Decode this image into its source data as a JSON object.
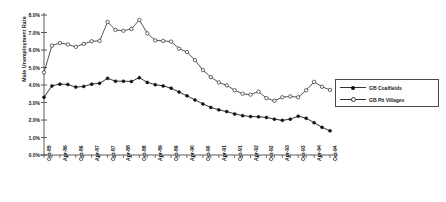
{
  "chart_data": {
    "type": "line",
    "title": "",
    "xlabel": "",
    "ylabel": "Male Unemployment Rate",
    "ylim": [
      0,
      8
    ],
    "ytick_labels": [
      "8.0%",
      "7.0%",
      "6.0%",
      "5.0%",
      "4.0%",
      "3.0%",
      "2.0%",
      "1.0%",
      "0.0%"
    ],
    "ytick_values": [
      8,
      7,
      6,
      5,
      4,
      3,
      2,
      1,
      0
    ],
    "grid": false,
    "legend_position": "right",
    "categories": [
      "Oct-85",
      "Jan-86",
      "Apr-86",
      "Jul-86",
      "Oct-86",
      "Jan-87",
      "Apr-87",
      "Jul-87",
      "Oct-87",
      "Jan-88",
      "Apr-88",
      "Jul-88",
      "Oct-88",
      "Jan-89",
      "Apr-89",
      "Jul-89",
      "Oct-89",
      "Jan-90",
      "Apr-90",
      "Jul-90",
      "Oct-90",
      "Jan-91",
      "Apr-91",
      "Jul-91",
      "Oct-91",
      "Jan-92",
      "Apr-92",
      "Jul-92",
      "Oct-92",
      "Jan-93",
      "Apr-93",
      "Jul-93",
      "Oct-93",
      "Jan-94",
      "Apr-94",
      "Jul-94",
      "Oct-94"
    ],
    "xtick_labels": [
      "Oct-85",
      "Apr-86",
      "Oct-86",
      "Apr-87",
      "Oct-87",
      "Apr-88",
      "Oct-88",
      "Apr-89",
      "Oct-89",
      "Apr-90",
      "Oct-90",
      "Apr-91",
      "Oct-91",
      "Apr-92",
      "Oct-92",
      "Apr-93",
      "Oct-93",
      "Apr-94",
      "Oct-94"
    ],
    "xtick_every": 2,
    "series": [
      {
        "name": "GB Coalfields",
        "marker": "filled-circle",
        "color": "#111111",
        "values": [
          3.3,
          3.95,
          4.05,
          4.03,
          3.88,
          3.92,
          4.05,
          4.1,
          4.38,
          4.22,
          4.22,
          4.2,
          4.42,
          4.15,
          4.02,
          3.95,
          3.82,
          3.6,
          3.38,
          3.15,
          2.92,
          2.72,
          2.58,
          2.48,
          2.35,
          2.25,
          2.2,
          2.18,
          2.15,
          2.05,
          1.98,
          2.05,
          2.22,
          2.1,
          1.85,
          1.58,
          1.38
        ]
      },
      {
        "name": "GB Pit Villages",
        "marker": "open-circle",
        "color": "#333333",
        "values": [
          4.72,
          6.25,
          6.4,
          6.32,
          6.18,
          6.35,
          6.5,
          6.52,
          7.6,
          7.15,
          7.1,
          7.2,
          7.72,
          6.95,
          6.55,
          6.52,
          6.48,
          6.08,
          5.88,
          5.42,
          4.85,
          4.45,
          4.15,
          3.98,
          3.7,
          3.5,
          3.45,
          3.62,
          3.25,
          3.1,
          3.3,
          3.35,
          3.3,
          3.7,
          4.18,
          3.9,
          3.72
        ]
      }
    ]
  }
}
